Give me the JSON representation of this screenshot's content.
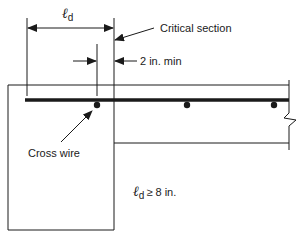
{
  "diagram": {
    "labels": {
      "ld_symbol": "ℓ",
      "ld_subscript": "d",
      "critical_section": "Critical section",
      "min_clearance": "2 in. min",
      "cross_wire": "Cross wire",
      "ld_condition_symbol": "ℓ",
      "ld_condition_subscript": "d",
      "ld_condition_text": "≥ 8 in."
    },
    "colors": {
      "line": "#1a1a1a",
      "background": "#ffffff"
    }
  }
}
